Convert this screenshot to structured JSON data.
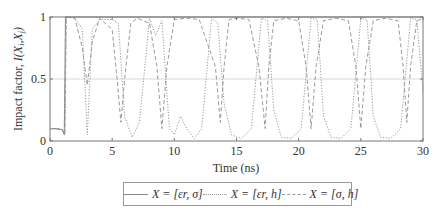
{
  "chart_data": {
    "type": "line",
    "title": "",
    "xlabel": "Time (ns)",
    "ylabel": "Impact factor, I(Xi,Xj)",
    "xlim": [
      0,
      30
    ],
    "ylim": [
      0,
      1
    ],
    "xticks": [
      0,
      5,
      10,
      15,
      20,
      25,
      30
    ],
    "yticks": [
      0,
      0.5,
      1
    ],
    "xtick_labels": [
      "0",
      "5",
      "10",
      "15",
      "20",
      "25",
      "30"
    ],
    "ytick_labels": [
      "0",
      "0.5",
      "1"
    ],
    "grid": "horizontal line at 0.5",
    "legend_position": "below plot, horizontal",
    "series": [
      {
        "name": "X = [εr, σ]",
        "style": "solid",
        "x": [
          0,
          0.5,
          1.0,
          1.15,
          1.2,
          1.25,
          2,
          5,
          10,
          15,
          20,
          25,
          30
        ],
        "y": [
          0.1,
          0.1,
          0.09,
          0.05,
          0.5,
          1.0,
          1.0,
          1.0,
          1.0,
          1.0,
          1.0,
          1.0,
          1.0
        ]
      },
      {
        "name": "X = [εr, h]",
        "style": "dotted",
        "x": [
          0,
          0.5,
          1.0,
          1.2,
          1.3,
          2.0,
          2.6,
          3.0,
          3.4,
          4.0,
          5.0,
          5.5,
          6.0,
          6.6,
          7.2,
          8.0,
          8.5,
          9.0,
          9.6,
          10.0,
          10.5,
          11.0,
          11.6,
          12.2,
          13.0,
          13.5,
          14.0,
          14.6,
          15.4,
          16.2,
          17.0,
          17.5,
          18.0,
          18.6,
          19.4,
          20.2,
          21.0,
          21.5,
          22.0,
          22.6,
          23.4,
          24.2,
          25.0,
          25.5,
          26.0,
          26.6,
          27.4,
          28.2,
          29.0,
          29.5,
          30.0
        ],
        "y": [
          0.1,
          0.1,
          0.09,
          0.05,
          1.0,
          0.99,
          0.9,
          0.05,
          0.9,
          0.98,
          0.98,
          0.95,
          0.2,
          0.03,
          0.15,
          0.99,
          0.85,
          0.97,
          0.1,
          0.05,
          0.2,
          0.1,
          0.02,
          0.1,
          0.99,
          0.95,
          0.3,
          0.05,
          0.02,
          0.1,
          0.99,
          0.97,
          0.25,
          0.03,
          0.02,
          0.1,
          0.99,
          0.98,
          0.2,
          0.03,
          0.02,
          0.1,
          0.99,
          0.98,
          0.2,
          0.03,
          0.02,
          0.1,
          0.99,
          0.98,
          0.4
        ]
      },
      {
        "name": "X = [σ, h]",
        "style": "dashed",
        "x": [
          0,
          0.5,
          1.0,
          1.2,
          1.3,
          2.0,
          2.6,
          3.0,
          3.4,
          4.0,
          5.0,
          5.4,
          5.7,
          6.0,
          6.5,
          7.0,
          8.0,
          8.6,
          9.0,
          9.4,
          10.0,
          11.0,
          12.0,
          13.3,
          13.7,
          14.0,
          14.4,
          15.0,
          16.0,
          16.8,
          17.3,
          17.6,
          18.0,
          19.0,
          20.0,
          20.6,
          21.0,
          21.4,
          22.0,
          23.0,
          24.0,
          24.6,
          25.0,
          25.4,
          26.0,
          27.0,
          28.0,
          28.4,
          28.7,
          29.0,
          29.5,
          30.0
        ],
        "y": [
          0.1,
          0.1,
          0.09,
          0.05,
          1.0,
          0.99,
          0.75,
          0.45,
          0.8,
          0.99,
          0.9,
          0.5,
          0.15,
          0.5,
          0.95,
          0.99,
          0.95,
          0.6,
          0.1,
          0.6,
          0.98,
          0.99,
          0.98,
          0.6,
          0.15,
          0.6,
          0.98,
          0.99,
          0.98,
          0.6,
          0.1,
          0.6,
          0.97,
          0.99,
          0.97,
          0.6,
          0.1,
          0.6,
          0.97,
          0.99,
          0.97,
          0.6,
          0.1,
          0.6,
          0.97,
          0.99,
          0.97,
          0.6,
          0.15,
          0.6,
          0.97,
          0.99
        ]
      }
    ]
  },
  "axes": {
    "xlabel": "Time (ns)",
    "ylabel_prefix": "Impact factor, ",
    "ylabel_italic": "I(X",
    "ylabel_sub_i": "i",
    "ylabel_mid": ",X",
    "ylabel_sub_j": "j",
    "ylabel_end": ")"
  },
  "legend": {
    "items": [
      {
        "label": "X = [εr, σ]",
        "style": "solid"
      },
      {
        "label": "X = [εr, h]",
        "style": "dotted"
      },
      {
        "label": "X = [σ, h]",
        "style": "dashed"
      }
    ]
  },
  "colors": {
    "solid": "#8a8a8a",
    "dotted": "#9a9a9a",
    "dashed": "#9a9a9a",
    "axis": "#777777",
    "gridline": "#d8d8d8"
  }
}
